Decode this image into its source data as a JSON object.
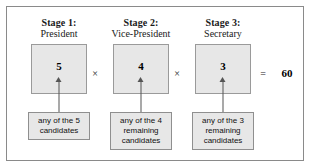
{
  "figure": {
    "frame_color": "#8a8a8a",
    "box_fill": "#e7e7e7",
    "box_border": "#9a9a9a",
    "arrow_color": "#555555"
  },
  "stages": [
    {
      "title": "Stage 1:",
      "role": "President",
      "count": "5",
      "note_lines": [
        "any of the 5",
        "candidates"
      ],
      "operator_after": "×"
    },
    {
      "title": "Stage 2:",
      "role": "Vice-President",
      "count": "4",
      "note_lines": [
        "any of the 4",
        "remaining",
        "candidates"
      ],
      "operator_after": "×"
    },
    {
      "title": "Stage 3:",
      "role": "Secretary",
      "count": "3",
      "note_lines": [
        "any of the 3",
        "remaining",
        "candidates"
      ],
      "operator_after": "="
    }
  ],
  "result": {
    "equals_sign": "=",
    "value": "60"
  }
}
